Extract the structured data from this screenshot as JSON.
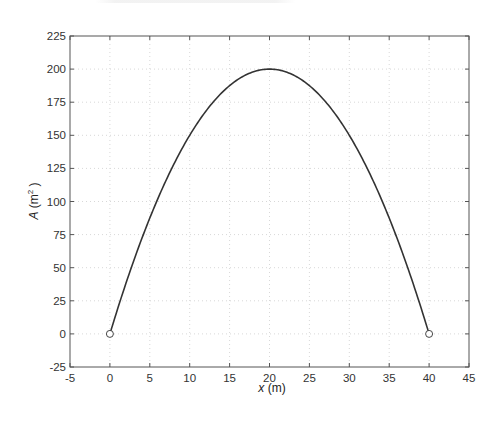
{
  "chart_data": {
    "type": "line",
    "title": "",
    "xlabel": "x (m)",
    "xlabel_var": "x",
    "xlabel_unit": "(m)",
    "ylabel": "A (m^2)",
    "ylabel_var": "A",
    "ylabel_unit_base": "(m",
    "ylabel_unit_exp": "2",
    "ylabel_unit_close": ")",
    "xlim": [
      -5,
      45
    ],
    "ylim": [
      -25,
      225
    ],
    "xticks": [
      -5,
      0,
      5,
      10,
      15,
      20,
      25,
      30,
      35,
      40,
      45
    ],
    "yticks": [
      -25,
      0,
      25,
      50,
      75,
      100,
      125,
      150,
      175,
      200,
      225
    ],
    "grid": true,
    "legend": null,
    "function": "A = x(40 - x)/2",
    "series": [
      {
        "name": "A(x)",
        "color": "#333333",
        "x": [
          0,
          2.5,
          5,
          7.5,
          10,
          12.5,
          15,
          17.5,
          20,
          22.5,
          25,
          27.5,
          30,
          32.5,
          35,
          37.5,
          40
        ],
        "values": [
          0,
          46.875,
          87.5,
          121.875,
          150,
          171.875,
          187.5,
          196.875,
          200,
          196.875,
          187.5,
          171.875,
          150,
          121.875,
          87.5,
          46.875,
          0
        ]
      }
    ],
    "markers": [
      {
        "x": 0,
        "y": 0,
        "style": "open-circle"
      },
      {
        "x": 40,
        "y": 0,
        "style": "open-circle"
      }
    ]
  },
  "colors": {
    "frame": "#555555",
    "grid": "#d8d8d8",
    "curve": "#333333",
    "text": "#333333"
  }
}
